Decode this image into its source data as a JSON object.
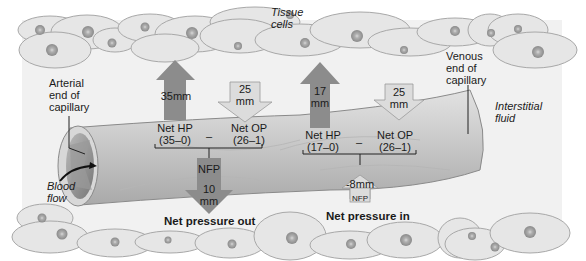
{
  "labels": {
    "tissue_cells": "Tissue\ncells",
    "arterial_end": "Arterial\nend of\ncapillary",
    "venous_end": "Venous\nend of\ncapillary",
    "interstitial_fluid": "Interstitial\nfluid",
    "blood_flow": "Blood\nflow"
  },
  "arterial": {
    "hp_arrow": "35mm",
    "op_arrow": "25\nmm",
    "net_hp": "Net HP\n(35–0)",
    "minus": "–",
    "net_op": "Net OP\n(26–1)",
    "nfp_label": "NFP",
    "nfp_value": "10\nmm",
    "result": "Net pressure out"
  },
  "venous": {
    "hp_arrow": "17\nmm",
    "op_arrow": "25\nmm",
    "net_hp": "Net HP\n(17–0)",
    "minus": "–",
    "net_op": "Net OP\n(26–1)",
    "nfp_value": "-8mm",
    "nfp_label": "NFP",
    "result": "Net pressure in"
  },
  "colors": {
    "dark_arrow": "#8c8c8c",
    "light_arrow": "#dcdcdc",
    "cell_fill": "#e6e6e6",
    "cell_stroke": "#a8a8a8",
    "nucleus": "#9a9a9a",
    "capillary": "#c8c8c8"
  }
}
